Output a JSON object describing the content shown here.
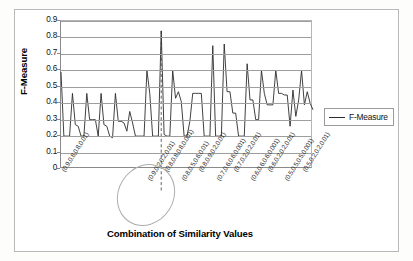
{
  "chart_data": {
    "type": "line",
    "title": "",
    "xlabel": "Combination of Similarity Values",
    "ylabel": "F-Measure",
    "ylim": [
      0,
      0.9
    ],
    "ytick_labels": [
      "0.9",
      "0.8",
      "0.7",
      "0.6",
      "0.5",
      "0.4",
      "0.3",
      "0.2",
      "0.1",
      "0"
    ],
    "ytick_values": [
      0.9,
      0.8,
      0.7,
      0.6,
      0.5,
      0.4,
      0.3,
      0.2,
      0.1,
      0
    ],
    "grid": true,
    "legend_position": "right",
    "series": [
      {
        "name": "F-Measure",
        "color": "#2b2b2b",
        "values": [
          0.59,
          0.2,
          0.2,
          0.2,
          0.46,
          0.27,
          0.26,
          0.2,
          0.2,
          0.46,
          0.3,
          0.3,
          0.3,
          0.2,
          0.46,
          0.27,
          0.26,
          0.2,
          0.19,
          0.46,
          0.29,
          0.29,
          0.28,
          0.23,
          0.35,
          0.28,
          0.2,
          0.2,
          0.2,
          0.2,
          0.6,
          0.46,
          0.2,
          0.2,
          0.2,
          0.84,
          0.21,
          0.2,
          0.2,
          0.6,
          0.43,
          0.47,
          0.41,
          0.2,
          0.2,
          0.29,
          0.46,
          0.46,
          0.46,
          0.46,
          0.2,
          0.2,
          0.2,
          0.75,
          0.2,
          0.2,
          0.2,
          0.76,
          0.47,
          0.47,
          0.34,
          0.34,
          0.2,
          0.2,
          0.2,
          0.64,
          0.42,
          0.42,
          0.3,
          0.3,
          0.6,
          0.46,
          0.39,
          0.39,
          0.39,
          0.6,
          0.46,
          0.46,
          0.45,
          0.45,
          0.26,
          0.48,
          0.32,
          0.42,
          0.6,
          0.39,
          0.47,
          0.4,
          0.36
        ]
      }
    ],
    "x_tick_labels": [
      "(0.9,0.8,0.8,0.01)",
      "(0.9,0.2,0.2,0.01)",
      "(0.8,0.8,0.8,0.001)",
      "(0.8,0.5,0.6,0.01)",
      "(0.8,0.9,0.2,0.01)",
      "(0.7,0.6,0.6,0.001)",
      "(0.7,0.2,0.2,0.01)",
      "(0.6,0.6,0.6,0.001)",
      "(0.6,0.2,0.2,0.01)",
      "(0.5,0.5,0.5,0.001)",
      "(0.5,0.2,0.2,0.01)"
    ],
    "x_tick_positions": [
      0,
      30,
      36,
      42,
      48,
      54,
      60,
      66,
      72,
      78,
      84
    ],
    "annotations": [
      {
        "name": "peak-callout",
        "type": "dashed-vertical-line",
        "at_index": 35,
        "value": 0.84,
        "label": "(0.8,0.5,0.6,0.01)"
      },
      {
        "name": "highlight-ellipse",
        "type": "ellipse",
        "target_label": "(0.8,0.5,0.6,0.01)"
      }
    ]
  },
  "legend": {
    "entries": [
      {
        "label": "F-Measure",
        "color": "#2b2b2b"
      }
    ]
  }
}
